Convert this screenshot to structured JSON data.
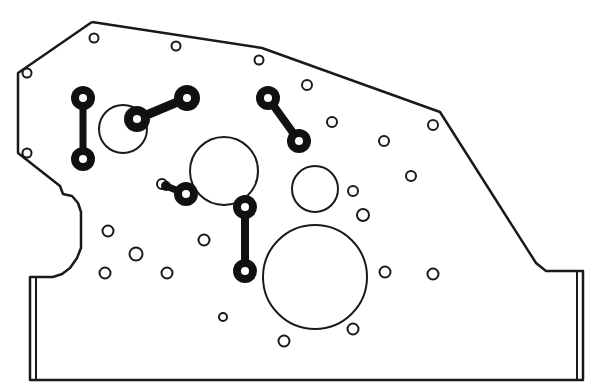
{
  "diagram": {
    "type": "mechanical-plate-drawing",
    "colors": {
      "stroke": "#1a1a1a",
      "background": "#ffffff",
      "fill": "#111111"
    },
    "outline": {
      "points": "92,22 262,48 440,112 536,263 546,271 583,271 583,380 30,380 30,277 53,277 62,274 70,268 77,258 81,248 81,212 78,203 72,196 63,194 60,186 18,153 18,73 92,22",
      "flange_left": {
        "x": 36,
        "y1": 277,
        "y2": 380
      },
      "flange_right": {
        "x": 577,
        "y1": 271,
        "y2": 380
      }
    },
    "small_holes": [
      {
        "cx": 94,
        "cy": 38,
        "r": 4.5
      },
      {
        "cx": 176,
        "cy": 46,
        "r": 4.5
      },
      {
        "cx": 259,
        "cy": 60,
        "r": 4.5
      },
      {
        "cx": 27,
        "cy": 73,
        "r": 4.5
      },
      {
        "cx": 27,
        "cy": 153,
        "r": 4.5
      },
      {
        "cx": 307,
        "cy": 85,
        "r": 5
      },
      {
        "cx": 332,
        "cy": 122,
        "r": 5
      },
      {
        "cx": 433,
        "cy": 125,
        "r": 5
      },
      {
        "cx": 384,
        "cy": 141,
        "r": 5
      },
      {
        "cx": 411,
        "cy": 176,
        "r": 5
      },
      {
        "cx": 353,
        "cy": 191,
        "r": 5
      },
      {
        "cx": 363,
        "cy": 215,
        "r": 6
      },
      {
        "cx": 108,
        "cy": 231,
        "r": 5.5
      },
      {
        "cx": 204,
        "cy": 240,
        "r": 5.5
      },
      {
        "cx": 136,
        "cy": 254,
        "r": 6.5
      },
      {
        "cx": 105,
        "cy": 273,
        "r": 5.5
      },
      {
        "cx": 167,
        "cy": 273,
        "r": 5.5
      },
      {
        "cx": 385,
        "cy": 272,
        "r": 5.5
      },
      {
        "cx": 433,
        "cy": 274,
        "r": 5.5
      },
      {
        "cx": 223,
        "cy": 317,
        "r": 4
      },
      {
        "cx": 353,
        "cy": 329,
        "r": 5.5
      },
      {
        "cx": 284,
        "cy": 341,
        "r": 5.5
      },
      {
        "cx": 162,
        "cy": 184,
        "r": 5
      }
    ],
    "large_circles": [
      {
        "cx": 123,
        "cy": 129,
        "r": 24
      },
      {
        "cx": 224,
        "cy": 171,
        "r": 34
      },
      {
        "cx": 315,
        "cy": 189,
        "r": 23
      },
      {
        "cx": 315,
        "cy": 277,
        "r": 52
      }
    ],
    "links": [
      {
        "x1": 83,
        "y1": 98,
        "x2": 83,
        "y2": 159,
        "r": 12,
        "hole": 4,
        "w": 7
      },
      {
        "x1": 137,
        "y1": 119,
        "x2": 187,
        "y2": 98,
        "r": 13,
        "hole": 4,
        "w": 9
      },
      {
        "x1": 268,
        "y1": 98,
        "x2": 299,
        "y2": 141,
        "r": 12,
        "hole": 4,
        "w": 8
      },
      {
        "x1": 245,
        "y1": 207,
        "x2": 245,
        "y2": 271,
        "r": 12,
        "hole": 4,
        "w": 8
      },
      {
        "x1": 166,
        "y1": 186,
        "x2": 186,
        "y2": 194,
        "r": 12,
        "hole": 4,
        "w": 7,
        "single_end": true
      }
    ]
  }
}
